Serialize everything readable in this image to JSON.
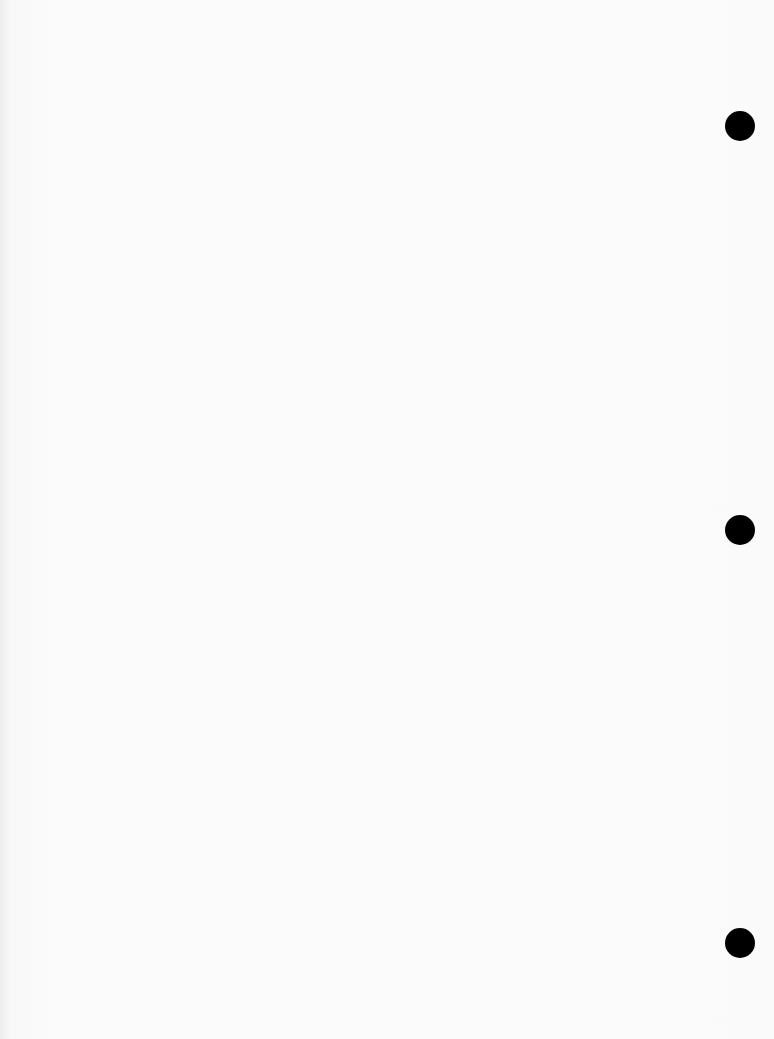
{
  "document": {
    "type": "blank scanned sheet (three-hole punched)",
    "visible_text": "",
    "bleed_through_note": "faint illegible text from reverse side"
  },
  "punch_holes": [
    {
      "cx": 740,
      "cy": 126
    },
    {
      "cx": 740,
      "cy": 530
    },
    {
      "cx": 740,
      "cy": 943
    }
  ],
  "colors": {
    "paper": "#fafafa",
    "hole": "#000000"
  }
}
